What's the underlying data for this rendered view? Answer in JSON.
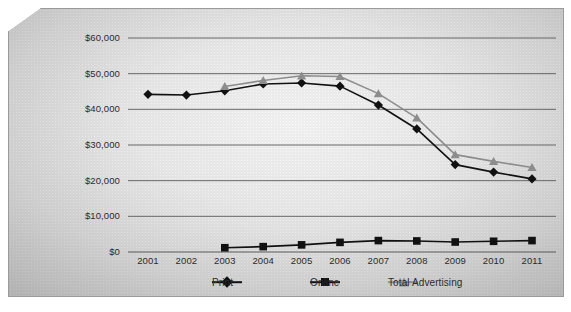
{
  "chart_data": {
    "type": "line",
    "title": "",
    "subtitle": "",
    "xlabel": "",
    "ylabel": "",
    "categories": [
      "2001",
      "2002",
      "2003",
      "2004",
      "2005",
      "2006",
      "2007",
      "2008",
      "2009",
      "2010",
      "2011"
    ],
    "ylim": [
      0,
      60000
    ],
    "ytick_step": 10000,
    "ytick_labels": [
      "$60,000",
      "$50,000",
      "$40,000",
      "$30,000",
      "$20,000",
      "$10,000",
      "$0"
    ],
    "ytick_values": [
      60000,
      50000,
      40000,
      30000,
      20000,
      10000,
      0
    ],
    "grid": true,
    "legend_position": "bottom",
    "series": [
      {
        "name": "Print",
        "marker": "diamond",
        "color": "#111111",
        "values": [
          44200,
          44000,
          45200,
          47100,
          47400,
          46500,
          41200,
          34500,
          24500,
          22400,
          20500
        ]
      },
      {
        "name": "Online",
        "marker": "square",
        "color": "#111111",
        "values": [
          null,
          null,
          1200,
          1500,
          2000,
          2700,
          3200,
          3100,
          2800,
          3000,
          3200
        ]
      },
      {
        "name": "Total Advertising",
        "marker": "triangle",
        "color": "#8d8d8d",
        "values": [
          null,
          null,
          46400,
          48100,
          49400,
          49200,
          44400,
          37600,
          27300,
          25400,
          23700
        ]
      }
    ]
  },
  "legend": {
    "items": [
      {
        "label": "Print",
        "marker": "diamond",
        "color": "#111111"
      },
      {
        "label": "Online",
        "marker": "square",
        "color": "#111111"
      },
      {
        "label": "Total Advertising",
        "marker": "triangle",
        "color": "#8d8d8d"
      }
    ]
  }
}
